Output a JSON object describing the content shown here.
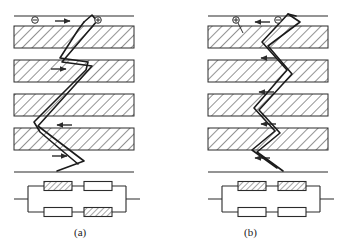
{
  "figure": {
    "title": "",
    "background_color": "#ffffff",
    "line_color": "#2b2b2b",
    "hatch_color": "#3a3a3a",
    "band_fill": "#ffffff",
    "panels": [
      {
        "id": "a",
        "caption": "(a)",
        "caption_x": 74,
        "caption_y": 226,
        "origin_x": 14,
        "width": 120,
        "top_rule_y": 16,
        "bottom_rule_y": 172,
        "bands": [
          {
            "y": 26,
            "height": 22,
            "hatched": true
          },
          {
            "y": 60,
            "height": 22,
            "hatched": true
          },
          {
            "y": 94,
            "height": 22,
            "hatched": true
          },
          {
            "y": 128,
            "height": 22,
            "hatched": true
          }
        ],
        "hatch_direction": "forward",
        "terminals": [
          {
            "name": "terminal-minus",
            "symbol": "⊖",
            "x": 35,
            "y": 20
          },
          {
            "name": "terminal-plus",
            "symbol": "⊕",
            "x": 98,
            "y": 20
          }
        ],
        "arrows": [
          {
            "name": "flow-arrow-1",
            "direction": "right",
            "x": 60,
            "y": 21,
            "length": 14
          },
          {
            "name": "flow-arrow-2",
            "direction": "right",
            "x": 56,
            "y": 69,
            "length": 14
          },
          {
            "name": "flow-arrow-3",
            "direction": "left",
            "x": 58,
            "y": 125,
            "length": 14
          },
          {
            "name": "flow-arrow-4",
            "direction": "right",
            "x": 57,
            "y": 156,
            "length": 14
          }
        ],
        "path_points": "84,20 92,16 97,20 92,30 78,48 64,62 87,62 93,68 86,80 60,108 44,122 36,124 38,134 53,146 74,158 84,162 78,164 64,152 40,132 34,122 46,110 62,96 88,70 93,64 86,60 68,58 76,46 90,28 95,20 90,17 84,22",
        "zigzag": [
          {
            "x": 92,
            "y": 16
          },
          {
            "x": 62,
            "y": 62
          },
          {
            "x": 90,
            "y": 66
          },
          {
            "x": 38,
            "y": 126
          },
          {
            "x": 84,
            "y": 160
          },
          {
            "x": 58,
            "y": 170
          }
        ],
        "circuit": {
          "left_x": 28,
          "right_x": 126,
          "top_y": 186,
          "bottom_y": 212,
          "lead_left_x": 14,
          "lead_right_x": 140,
          "resistors": [
            {
              "name": "resistor-top-left",
              "x": 44,
              "y": 182,
              "w": 28,
              "h": 9,
              "hatched": true
            },
            {
              "name": "resistor-top-right",
              "x": 84,
              "y": 182,
              "w": 28,
              "h": 9,
              "hatched": false
            },
            {
              "name": "resistor-bottom-left",
              "x": 44,
              "y": 208,
              "w": 28,
              "h": 9,
              "hatched": false
            },
            {
              "name": "resistor-bottom-right",
              "x": 84,
              "y": 208,
              "w": 28,
              "h": 9,
              "hatched": true
            }
          ]
        }
      },
      {
        "id": "b",
        "caption": "(b)",
        "caption_x": 244,
        "caption_y": 226,
        "origin_x": 208,
        "width": 120,
        "top_rule_y": 16,
        "bottom_rule_y": 172,
        "bands": [
          {
            "y": 26,
            "height": 22,
            "hatched": true
          },
          {
            "y": 60,
            "height": 22,
            "hatched": true
          },
          {
            "y": 94,
            "height": 22,
            "hatched": true
          },
          {
            "y": 128,
            "height": 22,
            "hatched": true
          }
        ],
        "hatch_direction": "forward",
        "terminals": [
          {
            "name": "terminal-plus",
            "symbol": "⊕",
            "x": 236,
            "y": 20
          },
          {
            "name": "terminal-minus",
            "symbol": "⊖",
            "x": 278,
            "y": 20
          }
        ],
        "arrows": [
          {
            "name": "flow-arrow-1",
            "direction": "left",
            "x": 254,
            "y": 22,
            "length": 14
          },
          {
            "name": "flow-arrow-2",
            "direction": "left",
            "x": 258,
            "y": 58,
            "length": 14
          },
          {
            "name": "flow-arrow-3",
            "direction": "left",
            "x": 256,
            "y": 92,
            "length": 14
          },
          {
            "name": "flow-arrow-4",
            "direction": "left",
            "x": 258,
            "y": 124,
            "length": 14
          },
          {
            "name": "flow-arrow-5",
            "direction": "left",
            "x": 254,
            "y": 158,
            "length": 14
          }
        ],
        "zigzag": [
          {
            "x": 290,
            "y": 16
          },
          {
            "x": 262,
            "y": 42
          },
          {
            "x": 286,
            "y": 70
          },
          {
            "x": 254,
            "y": 108
          },
          {
            "x": 274,
            "y": 130
          },
          {
            "x": 252,
            "y": 150
          },
          {
            "x": 276,
            "y": 168
          }
        ],
        "circuit": {
          "left_x": 222,
          "right_x": 320,
          "top_y": 186,
          "bottom_y": 212,
          "lead_left_x": 208,
          "lead_right_x": 334,
          "resistors": [
            {
              "name": "resistor-top-left",
              "x": 238,
              "y": 182,
              "w": 28,
              "h": 9,
              "hatched": true
            },
            {
              "name": "resistor-top-right",
              "x": 278,
              "y": 182,
              "w": 28,
              "h": 9,
              "hatched": true
            },
            {
              "name": "resistor-bottom-left",
              "x": 238,
              "y": 208,
              "w": 28,
              "h": 9,
              "hatched": false
            },
            {
              "name": "resistor-bottom-right",
              "x": 278,
              "y": 208,
              "w": 28,
              "h": 9,
              "hatched": false
            }
          ]
        }
      }
    ]
  }
}
